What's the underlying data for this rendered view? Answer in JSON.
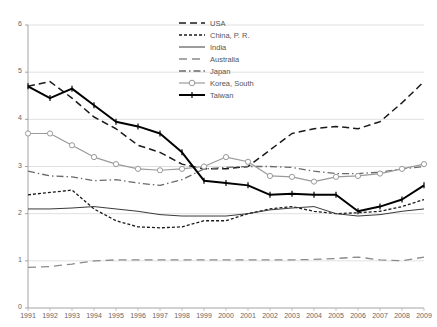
{
  "chart_data": {
    "type": "line",
    "title": "",
    "xlabel": "",
    "ylabel": "",
    "x": [
      1991,
      1992,
      1993,
      1994,
      1995,
      1996,
      1997,
      1998,
      1999,
      2000,
      2001,
      2002,
      2003,
      2004,
      2005,
      2006,
      2007,
      2008,
      2009
    ],
    "xlim": [
      1991,
      2009
    ],
    "ylim": [
      0,
      6
    ],
    "yticks": [
      0,
      1,
      2,
      3,
      4,
      5,
      6
    ],
    "grid": true,
    "legend_position": "top-center",
    "series": [
      {
        "name": "USA",
        "style": "dashed",
        "color": "#1a1a1a",
        "values": [
          4.7,
          4.8,
          4.45,
          4.05,
          3.8,
          3.45,
          3.3,
          3.05,
          2.95,
          2.95,
          3.0,
          3.35,
          3.7,
          3.8,
          3.85,
          3.8,
          3.95,
          4.35,
          4.8
        ]
      },
      {
        "name": "China, P. R.",
        "style": "dotted",
        "color": "#1a1a1a",
        "values": [
          2.4,
          2.45,
          2.5,
          2.1,
          1.85,
          1.72,
          1.7,
          1.72,
          1.85,
          1.85,
          2.0,
          2.1,
          2.15,
          2.05,
          2.0,
          2.02,
          2.05,
          2.15,
          2.3
        ]
      },
      {
        "name": "India",
        "style": "dash-dot-fine",
        "color": "#3a3a3a",
        "values": [
          2.1,
          2.1,
          2.12,
          2.15,
          2.1,
          2.05,
          1.98,
          1.95,
          1.95,
          1.95,
          2.0,
          2.08,
          2.12,
          2.15,
          2.0,
          1.95,
          1.98,
          2.05,
          2.1
        ]
      },
      {
        "name": "Australia",
        "style": "long-dash",
        "color": "#8a8a8a",
        "values": [
          0.86,
          0.88,
          0.93,
          1.0,
          1.02,
          1.02,
          1.02,
          1.02,
          1.02,
          1.02,
          1.02,
          1.02,
          1.02,
          1.03,
          1.05,
          1.08,
          1.02,
          1.0,
          1.08
        ]
      },
      {
        "name": "Japan",
        "style": "dash-dot",
        "color": "#6a6a6a",
        "values": [
          2.9,
          2.8,
          2.78,
          2.7,
          2.72,
          2.65,
          2.6,
          2.72,
          2.95,
          2.98,
          3.0,
          3.0,
          2.98,
          2.9,
          2.85,
          2.85,
          2.88,
          2.95,
          3.0
        ]
      },
      {
        "name": "Korea, South",
        "style": "solid-marker",
        "color": "#9a9a9a",
        "values": [
          3.7,
          3.7,
          3.45,
          3.2,
          3.05,
          2.95,
          2.92,
          2.95,
          3.0,
          3.2,
          3.1,
          2.8,
          2.78,
          2.68,
          2.78,
          2.8,
          2.85,
          2.95,
          3.05
        ]
      },
      {
        "name": "Taiwan",
        "style": "solid-thick",
        "color": "#000000",
        "values": [
          4.7,
          4.45,
          4.65,
          4.3,
          3.95,
          3.85,
          3.7,
          3.3,
          2.7,
          2.65,
          2.6,
          2.4,
          2.42,
          2.4,
          2.4,
          2.05,
          2.15,
          2.3,
          2.6
        ]
      }
    ]
  }
}
